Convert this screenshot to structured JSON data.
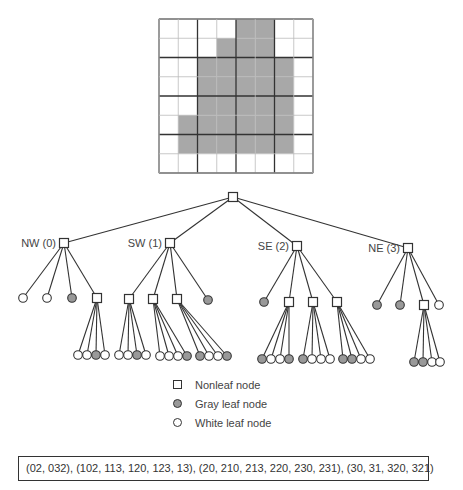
{
  "colors": {
    "gray_fill": "#a8a8a8",
    "leaf_gray": "#999999",
    "line": "#333333",
    "grid_thin": "#bbbbbb",
    "grid_thick": "#333333"
  },
  "grid": {
    "size": 8,
    "rows": [
      [
        0,
        0,
        0,
        0,
        1,
        1,
        0,
        0
      ],
      [
        0,
        0,
        0,
        1,
        1,
        1,
        0,
        0
      ],
      [
        0,
        0,
        1,
        1,
        1,
        1,
        1,
        0
      ],
      [
        0,
        0,
        1,
        1,
        1,
        1,
        1,
        0
      ],
      [
        0,
        0,
        1,
        1,
        1,
        1,
        1,
        0
      ],
      [
        0,
        1,
        1,
        1,
        1,
        1,
        1,
        0
      ],
      [
        0,
        1,
        1,
        1,
        1,
        1,
        1,
        0
      ],
      [
        0,
        0,
        0,
        0,
        0,
        0,
        0,
        0
      ]
    ]
  },
  "tree": {
    "root": {
      "x": 233,
      "y": 197
    },
    "quadrants": [
      {
        "label": "NW (0)",
        "x": 64,
        "y": 243,
        "children": [
          {
            "type": "white",
            "x": 23,
            "y": 298
          },
          {
            "type": "white",
            "x": 47,
            "y": 298
          },
          {
            "type": "gray",
            "x": 72,
            "y": 298
          },
          {
            "type": "nonleaf",
            "x": 97,
            "y": 298,
            "leaves": [
              {
                "type": "white",
                "x": 78,
                "y": 355
              },
              {
                "type": "white",
                "x": 87,
                "y": 355
              },
              {
                "type": "gray",
                "x": 96,
                "y": 355
              },
              {
                "type": "white",
                "x": 105,
                "y": 355
              }
            ]
          }
        ]
      },
      {
        "label": "SW (1)",
        "x": 170,
        "y": 243,
        "children": [
          {
            "type": "nonleaf",
            "x": 129,
            "y": 299,
            "leaves": [
              {
                "type": "white",
                "x": 119,
                "y": 355
              },
              {
                "type": "white",
                "x": 128,
                "y": 355
              },
              {
                "type": "gray",
                "x": 137,
                "y": 355
              },
              {
                "type": "white",
                "x": 146,
                "y": 355
              }
            ]
          },
          {
            "type": "nonleaf",
            "x": 153,
            "y": 299,
            "leaves": [
              {
                "type": "white",
                "x": 160,
                "y": 356
              },
              {
                "type": "white",
                "x": 169,
                "y": 356
              },
              {
                "type": "white",
                "x": 178,
                "y": 356
              },
              {
                "type": "gray",
                "x": 187,
                "y": 356
              }
            ]
          },
          {
            "type": "nonleaf",
            "x": 177,
            "y": 299,
            "leaves": [
              {
                "type": "gray",
                "x": 200,
                "y": 356
              },
              {
                "type": "white",
                "x": 209,
                "y": 356
              },
              {
                "type": "white",
                "x": 218,
                "y": 356
              },
              {
                "type": "gray",
                "x": 227,
                "y": 356
              }
            ]
          },
          {
            "type": "gray",
            "x": 208,
            "y": 300
          }
        ]
      },
      {
        "label": "SE (2)",
        "x": 297,
        "y": 246,
        "children": [
          {
            "type": "gray",
            "x": 264,
            "y": 302
          },
          {
            "type": "nonleaf",
            "x": 289,
            "y": 302,
            "leaves": [
              {
                "type": "gray",
                "x": 262,
                "y": 359
              },
              {
                "type": "white",
                "x": 271,
                "y": 359
              },
              {
                "type": "white",
                "x": 280,
                "y": 359
              },
              {
                "type": "gray",
                "x": 289,
                "y": 359
              }
            ]
          },
          {
            "type": "nonleaf",
            "x": 313,
            "y": 302,
            "leaves": [
              {
                "type": "gray",
                "x": 303,
                "y": 359
              },
              {
                "type": "white",
                "x": 312,
                "y": 359
              },
              {
                "type": "white",
                "x": 321,
                "y": 359
              },
              {
                "type": "white",
                "x": 330,
                "y": 359
              }
            ]
          },
          {
            "type": "nonleaf",
            "x": 337,
            "y": 302,
            "leaves": [
              {
                "type": "gray",
                "x": 343,
                "y": 359
              },
              {
                "type": "gray",
                "x": 352,
                "y": 359
              },
              {
                "type": "white",
                "x": 361,
                "y": 359
              },
              {
                "type": "white",
                "x": 370,
                "y": 359
              }
            ]
          }
        ]
      },
      {
        "label": "NE (3)",
        "x": 408,
        "y": 248,
        "children": [
          {
            "type": "gray",
            "x": 377,
            "y": 305
          },
          {
            "type": "gray",
            "x": 400,
            "y": 305
          },
          {
            "type": "nonleaf",
            "x": 424,
            "y": 305,
            "leaves": [
              {
                "type": "gray",
                "x": 414,
                "y": 362
              },
              {
                "type": "gray",
                "x": 423,
                "y": 362
              },
              {
                "type": "white",
                "x": 432,
                "y": 362
              },
              {
                "type": "white",
                "x": 440,
                "y": 362
              }
            ]
          },
          {
            "type": "white",
            "x": 439,
            "y": 305
          }
        ]
      }
    ]
  },
  "legend": {
    "items": [
      {
        "symbol": "square",
        "label": "Nonleaf node"
      },
      {
        "symbol": "gray-circle",
        "label": "Gray leaf node"
      },
      {
        "symbol": "white-circle",
        "label": "White leaf node"
      }
    ]
  },
  "codes": {
    "text": "(02, 032), (102, 113, 120, 123, 13), (20, 210, 213, 220, 230, 231), (30, 31, 320, 321)"
  }
}
